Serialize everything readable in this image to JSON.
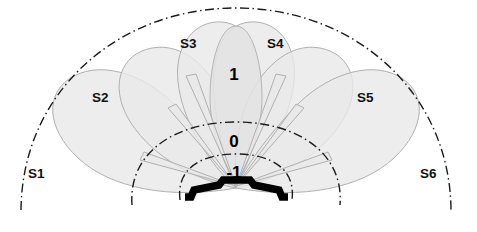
{
  "diagram": {
    "canvas": {
      "width": 477,
      "height": 232,
      "background": "#ffffff"
    },
    "origin": {
      "x": 236,
      "y": 188
    },
    "colors": {
      "lobe_fill": "#e9e9e9",
      "lobe_stroke": "#b0b0b0",
      "center_lobe_fill": "#e3e3e3",
      "arc_stroke": "#1b1b1b",
      "array_stroke": "#000000",
      "label_text": "#111111"
    },
    "sectors": [
      {
        "id": "S1",
        "label": "S1",
        "label_x": 28,
        "label_y": 178,
        "angle_deg": 165,
        "span_deg": 52
      },
      {
        "id": "S2",
        "label": "S2",
        "label_x": 92,
        "label_y": 102,
        "angle_deg": 141,
        "span_deg": 52
      },
      {
        "id": "S3",
        "label": "S3",
        "label_x": 180,
        "label_y": 48,
        "angle_deg": 117,
        "span_deg": 52
      },
      {
        "id": "S4",
        "label": "S4",
        "label_x": 267,
        "label_y": 48,
        "angle_deg": 63,
        "span_deg": 52
      },
      {
        "id": "S5",
        "label": "S5",
        "label_x": 357,
        "label_y": 102,
        "angle_deg": 39,
        "span_deg": 52
      },
      {
        "id": "S6",
        "label": "S6",
        "label_x": 420,
        "label_y": 178,
        "angle_deg": 15,
        "span_deg": 52
      }
    ],
    "center_beam": {
      "id": "center",
      "label": "1",
      "angle_deg": 90
    },
    "range_labels": [
      {
        "id": "range-plus-1",
        "value": "1",
        "x": 234,
        "y": 80
      },
      {
        "id": "range-zero",
        "value": "0",
        "x": 234,
        "y": 147
      },
      {
        "id": "range-minus-1",
        "value": "-1",
        "x": 234,
        "y": 178
      }
    ],
    "range_arcs": [
      {
        "id": "outer-arc",
        "radius": 215,
        "label_ref": "1"
      },
      {
        "id": "middle-arc",
        "radius": 70,
        "label_ref": "0"
      },
      {
        "id": "inner-arc",
        "radius": 38,
        "label_ref": "-1"
      }
    ],
    "antenna_array": {
      "id": "antenna-array",
      "name": "phased-array-element",
      "path": "M 185 197 L 191 197 L 194 190 L 219 185 L 223 180 L 250 180 L 254 185 L 279 190 L 282 197 L 288 197"
    }
  }
}
